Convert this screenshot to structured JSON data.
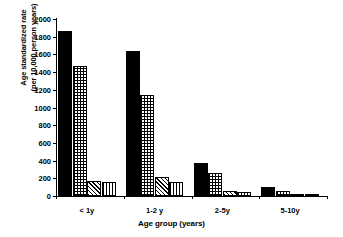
{
  "chart_data": {
    "type": "bar",
    "title": "",
    "xlabel": "Age group (years)",
    "ylabel_line1": "Age standardized rate",
    "ylabel_line2": "(per 10,000 person years)",
    "categories": [
      "< 1y",
      "1-2 y",
      "2-5y",
      "5-10y"
    ],
    "ylim": [
      0,
      2000
    ],
    "yticks": [
      0,
      200,
      400,
      600,
      800,
      1000,
      1200,
      1400,
      1600,
      1800,
      2000
    ],
    "ytick_labels": [
      "0",
      "200",
      "400",
      "600",
      "800",
      "1000",
      "1200",
      "1400",
      "1600",
      "1800",
      "2000"
    ],
    "grid": false,
    "legend": "none",
    "series": [
      {
        "name": "series-1",
        "pattern": "solid-black",
        "values": [
          1870,
          1640,
          370,
          105
        ]
      },
      {
        "name": "series-2",
        "pattern": "grid-checkered",
        "values": [
          1470,
          1140,
          265,
          55
        ]
      },
      {
        "name": "series-3",
        "pattern": "diagonal-hatch",
        "values": [
          170,
          210,
          60,
          12
        ]
      },
      {
        "name": "series-4",
        "pattern": "vertical-stripes",
        "values": [
          160,
          160,
          45,
          8
        ]
      }
    ]
  },
  "colors": {
    "axis": "#000000",
    "bar_outline": "#000000",
    "background": "#ffffff"
  }
}
